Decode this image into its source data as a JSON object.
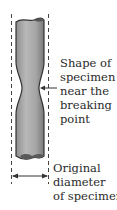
{
  "diagram": {
    "labels": {
      "shape": [
        "Shape of",
        "specimen",
        "near the",
        "breaking",
        "point"
      ],
      "original": [
        "Original",
        "diameter",
        "of specimen"
      ]
    },
    "colors": {
      "specimen_fill": "#a9a9a9",
      "specimen_dark": "#555555",
      "outline": "#333333",
      "dashed_lines": "#444444",
      "text": "#2a2a2a"
    }
  }
}
